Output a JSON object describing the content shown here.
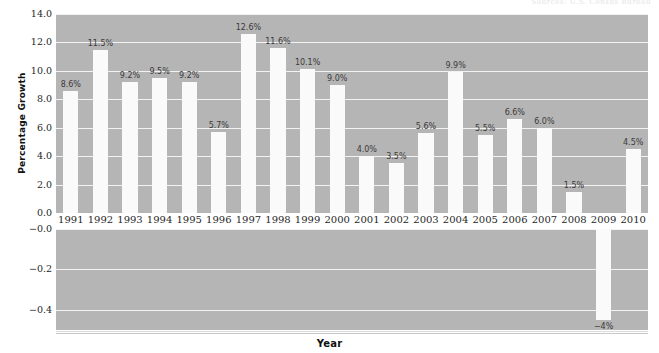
{
  "top_note": "Sources: U.S. Census Bureau",
  "chart_data": {
    "type": "bar",
    "title": "",
    "subtitle": "",
    "xlabel": "Year",
    "ylabel": "Percentage Growth",
    "legend": [],
    "grid": true,
    "broken_axis": true,
    "categories": [
      "1991",
      "1992",
      "1993",
      "1994",
      "1995",
      "1996",
      "1997",
      "1998",
      "1999",
      "2000",
      "2001",
      "2002",
      "2003",
      "2004",
      "2005",
      "2006",
      "2007",
      "2008",
      "2009",
      "2010"
    ],
    "values": [
      8.6,
      11.5,
      9.2,
      9.5,
      9.2,
      5.7,
      12.6,
      11.6,
      10.1,
      9.0,
      4.0,
      3.5,
      5.6,
      9.9,
      5.5,
      6.6,
      6.0,
      1.5,
      -0.45,
      4.5
    ],
    "data_labels": [
      "8.6%",
      "11.5%",
      "9.2%",
      "9.5%",
      "9.2%",
      "5.7%",
      "12.6%",
      "11.6%",
      "10.1%",
      "9.0%",
      "4.0%",
      "3.5%",
      "5.6%",
      "9.9%",
      "5.5%",
      "6.6%",
      "6.0%",
      "1.5%",
      "−4%",
      "4.5%"
    ],
    "upper_panel": {
      "ylim": [
        0.0,
        14.0
      ],
      "yticks": [
        0.0,
        2.0,
        4.0,
        6.0,
        8.0,
        10.0,
        12.0,
        14.0
      ],
      "ytick_labels": [
        "0.0",
        "2.0",
        "4.0",
        "6.0",
        "8.0",
        "10.0",
        "12.0",
        "14.0"
      ]
    },
    "lower_panel": {
      "ylim": [
        -0.5,
        0.0
      ],
      "yticks": [
        -0.0,
        -0.2,
        -0.4
      ],
      "ytick_labels": [
        "−0.0",
        "−0.2",
        "−0.4"
      ]
    },
    "colors": {
      "plot_background": "#b5b5b5",
      "bar_fill": "#fafafa",
      "gridline": "#f2f2f2",
      "text": "#2b2b2b",
      "figure_background": "#ffffff"
    }
  }
}
